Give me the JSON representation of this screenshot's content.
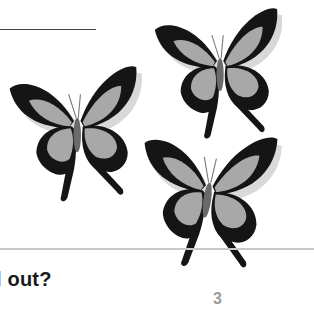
{
  "question": {
    "text": "l out?"
  },
  "page_number": {
    "text": "3"
  },
  "illustration": {
    "subject": "butterflies",
    "count": 3,
    "colors": {
      "wing_dark": "#151515",
      "wing_light": "#a8a8a8",
      "body": "#6a6a6a",
      "ground_line": "#c8c8c8"
    }
  }
}
